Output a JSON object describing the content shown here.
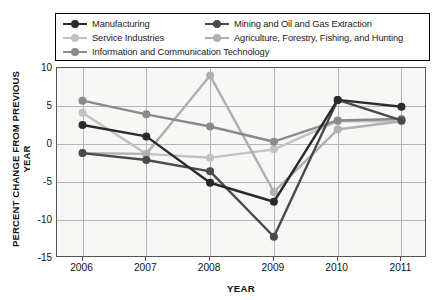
{
  "chart_data": {
    "type": "line",
    "title": "",
    "xlabel": "YEAR",
    "ylabel": "PERCENT CHANGE FROM PREVIOUS YEAR",
    "categories": [
      "2006",
      "2007",
      "2008",
      "2009",
      "2010",
      "2011"
    ],
    "x": [
      2006,
      2007,
      2008,
      2009,
      2010,
      2011
    ],
    "xlim": [
      2005.6,
      2011.4
    ],
    "ylim": [
      -15,
      10
    ],
    "yticks": [
      10,
      5,
      0,
      -5,
      -10,
      -15
    ],
    "ytick_labels": [
      "10",
      "5",
      "0",
      "-5",
      "-10",
      "-15"
    ],
    "grid": true,
    "legend_position": "top",
    "series": [
      {
        "name": "Manufacturing",
        "color": "#2b2b2b",
        "values": [
          2.5,
          1.0,
          -5.1,
          -7.6,
          5.8,
          4.9
        ]
      },
      {
        "name": "Mining and Oil and Gas Extraction",
        "color": "#4a4a4a",
        "values": [
          -1.2,
          -2.1,
          -3.6,
          -12.2,
          5.8,
          3.1
        ]
      },
      {
        "name": "Service Industries",
        "color": "#c2c2c2",
        "values": [
          4.1,
          -1.3,
          -1.8,
          -0.7,
          3.0,
          3.0
        ]
      },
      {
        "name": "Agriculture, Forestry, Fishing, and Hunting",
        "color": "#b0b0b0",
        "values": [
          -1.2,
          -1.3,
          9.0,
          -6.3,
          1.9,
          3.0
        ]
      },
      {
        "name": "Information and Communication Technology",
        "color": "#8a8a8a",
        "values": [
          5.7,
          3.9,
          2.3,
          0.3,
          3.1,
          3.3
        ]
      }
    ],
    "legend_layout": [
      [
        {
          "series_index": 0,
          "label": "Manufacturing"
        },
        {
          "series_index": 1,
          "label": "Mining and Oil and Gas Extraction"
        }
      ],
      [
        {
          "series_index": 2,
          "label": "Service Industries"
        },
        {
          "series_index": 3,
          "label": "Agriculture, Forestry, Fishing, and Hunting"
        }
      ],
      [
        {
          "series_index": 4,
          "label": "Information and Communication Technology"
        }
      ]
    ]
  }
}
